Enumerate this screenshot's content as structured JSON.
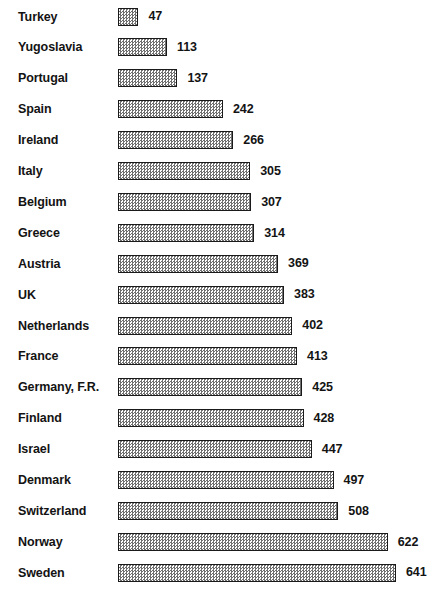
{
  "chart_data": {
    "type": "bar",
    "orientation": "horizontal",
    "title": "",
    "subtitle": "",
    "xlabel": "",
    "ylabel": "",
    "grid": false,
    "legend": null,
    "axis_visible": false,
    "xlim": [
      0,
      641
    ],
    "categories": [
      "Turkey",
      "Yugoslavia",
      "Portugal",
      "Spain",
      "Ireland",
      "Italy",
      "Belgium",
      "Greece",
      "Austria",
      "UK",
      "Netherlands",
      "France",
      "Germany, F.R.",
      "Finland",
      "Israel",
      "Denmark",
      "Switzerland",
      "Norway",
      "Sweden"
    ],
    "values": [
      47,
      113,
      137,
      242,
      266,
      305,
      307,
      314,
      369,
      383,
      402,
      413,
      425,
      428,
      447,
      497,
      508,
      622,
      641
    ],
    "value_labels": [
      "47",
      "113",
      "137",
      "242",
      "266",
      "305",
      "307",
      "314",
      "369",
      "383",
      "402",
      "413",
      "425",
      "428",
      "447",
      "497",
      "508",
      "622",
      "641"
    ],
    "bar_fill": "#6f6f6f",
    "bar_border": "#1a1a1a",
    "background": "#ffffff",
    "text_color": "#131313"
  },
  "rows": [
    {
      "label": "Turkey",
      "value": 47,
      "value_label": "47"
    },
    {
      "label": "Yugoslavia",
      "value": 113,
      "value_label": "113"
    },
    {
      "label": "Portugal",
      "value": 137,
      "value_label": "137"
    },
    {
      "label": "Spain",
      "value": 242,
      "value_label": "242"
    },
    {
      "label": "Ireland",
      "value": 266,
      "value_label": "266"
    },
    {
      "label": "Italy",
      "value": 305,
      "value_label": "305"
    },
    {
      "label": "Belgium",
      "value": 307,
      "value_label": "307"
    },
    {
      "label": "Greece",
      "value": 314,
      "value_label": "314"
    },
    {
      "label": "Austria",
      "value": 369,
      "value_label": "369"
    },
    {
      "label": "UK",
      "value": 383,
      "value_label": "383"
    },
    {
      "label": "Netherlands",
      "value": 402,
      "value_label": "402"
    },
    {
      "label": "France",
      "value": 413,
      "value_label": "413"
    },
    {
      "label": "Germany, F.R.",
      "value": 425,
      "value_label": "425"
    },
    {
      "label": "Finland",
      "value": 428,
      "value_label": "428"
    },
    {
      "label": "Israel",
      "value": 447,
      "value_label": "447"
    },
    {
      "label": "Denmark",
      "value": 497,
      "value_label": "497"
    },
    {
      "label": "Switzerland",
      "value": 508,
      "value_label": "508"
    },
    {
      "label": "Norway",
      "value": 622,
      "value_label": "622"
    },
    {
      "label": "Sweden",
      "value": 641,
      "value_label": "641"
    }
  ],
  "layout": {
    "row_height": 30.9,
    "first_row_top": 1,
    "bar_left": 118,
    "px_per_unit": 0.4337
  }
}
